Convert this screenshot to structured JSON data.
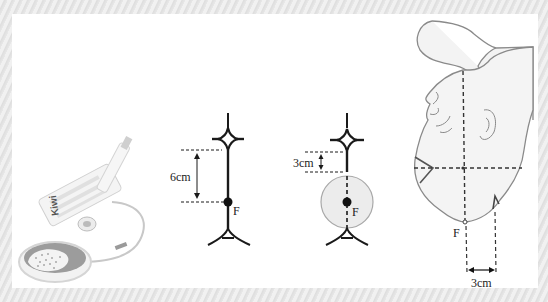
{
  "figure": {
    "panels": [
      {
        "id": "device",
        "description": "Kiwi vacuum extractor device with suction cup",
        "device_label": "Kiwi"
      },
      {
        "id": "flexion-point-diagram",
        "distance_label": "6cm",
        "point_label": "F"
      },
      {
        "id": "cup-on-flexion-point",
        "distance_label": "3cm",
        "point_label": "F"
      },
      {
        "id": "fetal-head-diagram",
        "point_label": "F",
        "distance_label": "3cm"
      }
    ]
  },
  "colors": {
    "frame": "#e9e9e9",
    "panel": "#ffffff",
    "line": "#1a1a1a",
    "outline": "#8a8a8a",
    "cup_fill": "#ececec"
  }
}
